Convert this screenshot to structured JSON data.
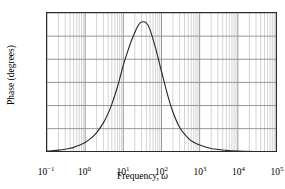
{
  "chart_data": {
    "type": "line",
    "title": "",
    "xlabel": "Frequency, ω",
    "ylabel": "Phase (degrees)",
    "xscale": "log",
    "xlim": [
      0.1,
      100000
    ],
    "ylim": [
      -180,
      -120
    ],
    "yticks": [
      -120,
      -130,
      -140,
      -150,
      -160,
      -170,
      -180
    ],
    "ytick_labels": [
      "−120",
      "−130",
      "−140",
      "−150",
      "−160",
      "−170",
      "−180"
    ],
    "xticks": [
      0.1,
      1,
      10,
      100,
      1000,
      10000,
      100000
    ],
    "xtick_mantissas": [
      "10",
      "10",
      "10",
      "10",
      "10",
      "10",
      "10"
    ],
    "xtick_exponents": [
      "−1",
      "0",
      "1",
      "2",
      "3",
      "4",
      "5"
    ],
    "grid": "on",
    "grid_minor": "on",
    "legend": "none",
    "line_color": "#2b2b2b",
    "grid_major_color": "#8c8c8c",
    "grid_minor_color": "#c9c9c9",
    "frame_color": "#2b2b2b",
    "peak": {
      "x": 25,
      "y": -123.5
    },
    "x": [
      0.1,
      0.15,
      0.2,
      0.3,
      0.4,
      0.5,
      0.7,
      1.0,
      1.5,
      2.0,
      3.0,
      4.0,
      5.0,
      7.0,
      10.0,
      13.0,
      16.0,
      20.0,
      25.0,
      30.0,
      40.0,
      50.0,
      70.0,
      100.0,
      150.0,
      200.0,
      300.0,
      500.0,
      700.0,
      1000.0,
      2000.0,
      5000.0,
      10000.0,
      30000.0,
      100000.0
    ],
    "y": [
      -179.7,
      -179.5,
      -179.3,
      -178.9,
      -178.5,
      -178.1,
      -177.2,
      -176.0,
      -173.8,
      -171.7,
      -167.5,
      -163.4,
      -159.4,
      -152.0,
      -142.5,
      -136.6,
      -132.3,
      -128.4,
      -125.2,
      -123.9,
      -124.3,
      -127.2,
      -135.2,
      -145.3,
      -156.4,
      -162.9,
      -169.5,
      -174.1,
      -175.9,
      -177.1,
      -178.6,
      -179.4,
      -179.7,
      -179.9,
      -180.0
    ]
  }
}
